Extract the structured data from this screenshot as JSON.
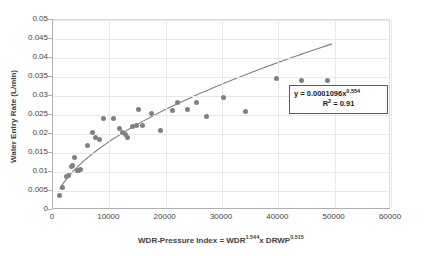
{
  "chart_data": {
    "type": "scatter",
    "title": "",
    "xlabel": "WDR-Pressure Index = WDR1.544x DRWP0.515",
    "xlabel_parts": {
      "pre": "WDR-Pressure Index = WDR",
      "sup1": "1.544",
      "mid": "x DRWP",
      "sup2": "0.515"
    },
    "ylabel": "Water Entry Rate (L/min)",
    "xlim": [
      0,
      60000
    ],
    "ylim": [
      0,
      0.05
    ],
    "grid": true,
    "legend": "none",
    "x_ticks": [
      "0",
      "10000",
      "20000",
      "30000",
      "40000",
      "50000",
      "60000"
    ],
    "x_tick_values": [
      0,
      10000,
      20000,
      30000,
      40000,
      50000,
      60000
    ],
    "y_ticks": [
      "0",
      "0.005",
      "0.01",
      "0.015",
      "0.02",
      "0.025",
      "0.03",
      "0.035",
      "0.04",
      "0.045",
      "0.05"
    ],
    "y_tick_values": [
      0,
      0.005,
      0.01,
      0.015,
      0.02,
      0.025,
      0.03,
      0.035,
      0.04,
      0.045,
      0.05
    ],
    "marker_color": "#808080",
    "trendline_color": "#7f7f7f",
    "series": [
      {
        "name": "Water Entry Rate",
        "points": [
          [
            1200,
            0.0037
          ],
          [
            1700,
            0.0058
          ],
          [
            2400,
            0.0087
          ],
          [
            2700,
            0.0091
          ],
          [
            3200,
            0.0115
          ],
          [
            3500,
            0.0118
          ],
          [
            3900,
            0.0138
          ],
          [
            4300,
            0.0103
          ],
          [
            4600,
            0.0105
          ],
          [
            4900,
            0.0107
          ],
          [
            6200,
            0.017
          ],
          [
            7000,
            0.0205
          ],
          [
            7600,
            0.019
          ],
          [
            8200,
            0.0186
          ],
          [
            8900,
            0.024
          ],
          [
            10700,
            0.024
          ],
          [
            11800,
            0.0215
          ],
          [
            12400,
            0.0205
          ],
          [
            12900,
            0.02
          ],
          [
            13200,
            0.0192
          ],
          [
            14100,
            0.022
          ],
          [
            14900,
            0.0222
          ],
          [
            15200,
            0.0265
          ],
          [
            15900,
            0.0222
          ],
          [
            17400,
            0.0255
          ],
          [
            19100,
            0.0208
          ],
          [
            21300,
            0.0262
          ],
          [
            22100,
            0.0283
          ],
          [
            23900,
            0.0265
          ],
          [
            25400,
            0.0283
          ],
          [
            27300,
            0.0245
          ],
          [
            30200,
            0.0297
          ],
          [
            34100,
            0.026
          ],
          [
            39600,
            0.0345
          ],
          [
            44200,
            0.0342
          ],
          [
            48800,
            0.0342
          ]
        ]
      }
    ],
    "trendline": {
      "type": "power",
      "coefficient": 0.0001096,
      "exponent": 0.554,
      "r_squared": 0.91,
      "x_start": 1200,
      "x_end": 49500
    },
    "annotation": {
      "equation_prefix": "y = 0.0001096x",
      "equation_exponent": "0.554",
      "r2_prefix": "R",
      "r2_sup": "2",
      "r2_value": " = 0.91"
    }
  }
}
